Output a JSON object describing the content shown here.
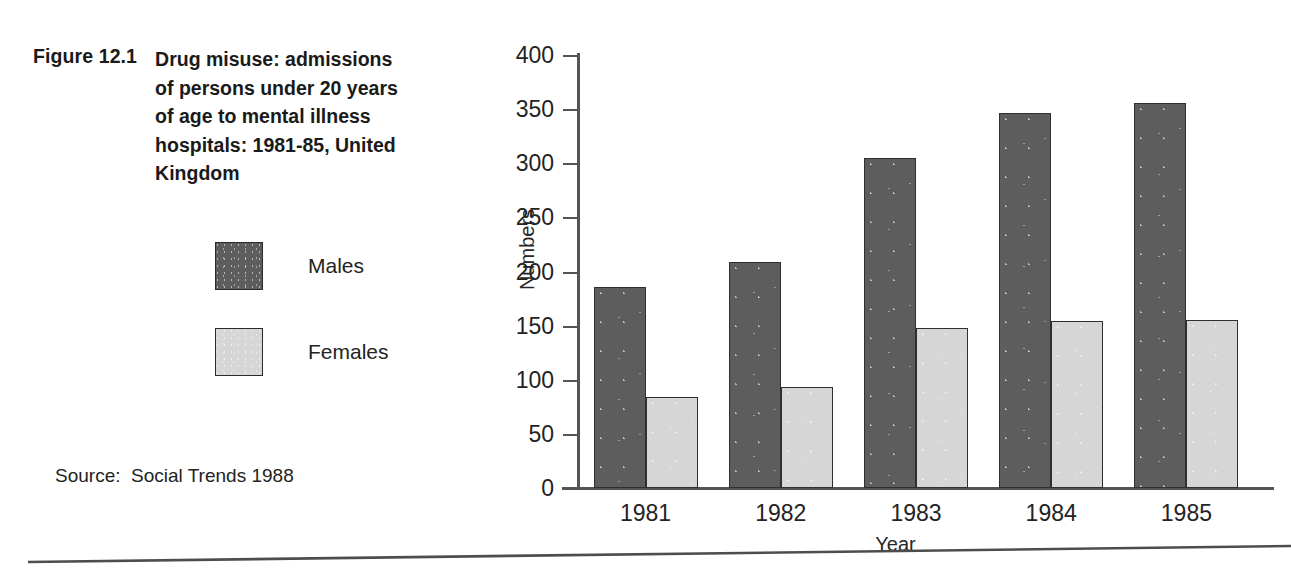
{
  "figure": {
    "number": "Figure 12.1",
    "title": "Drug misuse: admissions of persons under 20 years of age to mental illness hospitals: 1981-85, United Kingdom",
    "source": "Source:  Social Trends 1988"
  },
  "legend": {
    "position": "left-panel",
    "items": [
      {
        "label": "Males",
        "color": "#5d5d5d"
      },
      {
        "label": "Females",
        "color": "#d6d6d6"
      }
    ]
  },
  "axes": {
    "y_ticks": [
      "400",
      "350",
      "300",
      "250",
      "200",
      "150",
      "100",
      "50",
      "0"
    ],
    "x_labels": [
      "1981",
      "1982",
      "1983",
      "1984",
      "1985"
    ],
    "ylabel": "Numbers",
    "xlabel": "Year"
  },
  "chart_data": {
    "type": "bar",
    "title": "Drug misuse: admissions of persons under 20 years of age to mental illness hospitals: 1981-85, United Kingdom",
    "categories": [
      "1981",
      "1982",
      "1983",
      "1984",
      "1985"
    ],
    "series": [
      {
        "name": "Males",
        "color": "#5d5d5d",
        "values": [
          186,
          209,
          305,
          346,
          356
        ]
      },
      {
        "name": "Females",
        "color": "#d6d6d6",
        "values": [
          84,
          93,
          148,
          154,
          155
        ]
      }
    ],
    "xlabel": "Year",
    "ylabel": "Numbers",
    "ylim": [
      0,
      400
    ],
    "ytick_step": 50,
    "grid": false,
    "legend_position": "left",
    "source": "Social Trends 1988"
  }
}
